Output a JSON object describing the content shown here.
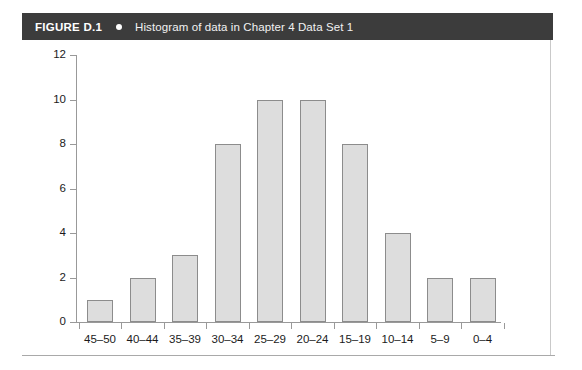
{
  "header": {
    "figure_label": "FIGURE D.1",
    "bullet_icon": "bullet-dot-icon",
    "title": "Histogram of data in Chapter 4 Data Set 1",
    "bar_color": "#3c3c3c",
    "text_color": "#ffffff"
  },
  "chart_data": {
    "type": "bar",
    "title": "Histogram of data in Chapter 4 Data Set 1",
    "xlabel": "",
    "ylabel": "",
    "categories": [
      "45–50",
      "40–44",
      "35–39",
      "30–34",
      "25–29",
      "20–24",
      "15–19",
      "10–14",
      "5–9",
      "0–4"
    ],
    "values": [
      1,
      2,
      3,
      8,
      10,
      10,
      8,
      4,
      2,
      2
    ],
    "ylim": [
      0,
      12
    ],
    "ytick_labels": [
      "0",
      "2",
      "4",
      "6",
      "8",
      "10",
      "12"
    ],
    "ytick_values": [
      0,
      2,
      4,
      6,
      8,
      10,
      12
    ],
    "grid": false,
    "legend": false,
    "bar_fill_color": "#dddddd",
    "bar_border_color": "#8c8c8c",
    "axis_color": "#999999",
    "background_color": "#ffffff"
  }
}
